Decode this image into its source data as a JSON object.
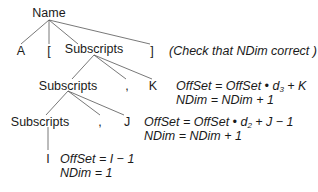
{
  "tree": {
    "root": "Name",
    "level1": {
      "a": "A",
      "lbracket": "[",
      "subscripts": "Subscripts",
      "rbracket": "]"
    },
    "note": "(Check that NDim correct )",
    "level2": {
      "subscripts": "Subscripts",
      "comma": ",",
      "k": "K"
    },
    "level3": {
      "subscripts": "Subscripts",
      "comma": ",",
      "j": "J"
    },
    "level4": {
      "i": "I"
    }
  },
  "actions": {
    "k": {
      "line1_pre": "OffSet = OffSet • d",
      "line1_sub": "3",
      "line1_post": " + K",
      "line2": "NDim = NDim + 1"
    },
    "j": {
      "line1_pre": "OffSet = OffSet • d",
      "line1_sub": "2",
      "line1_post": " + J − 1",
      "line2": "NDim = NDim + 1"
    },
    "i": {
      "line1": "OffSet = I − 1",
      "line2": "NDim = 1"
    }
  },
  "colors": {
    "line": "#555555",
    "text": "#1a1a1a"
  }
}
